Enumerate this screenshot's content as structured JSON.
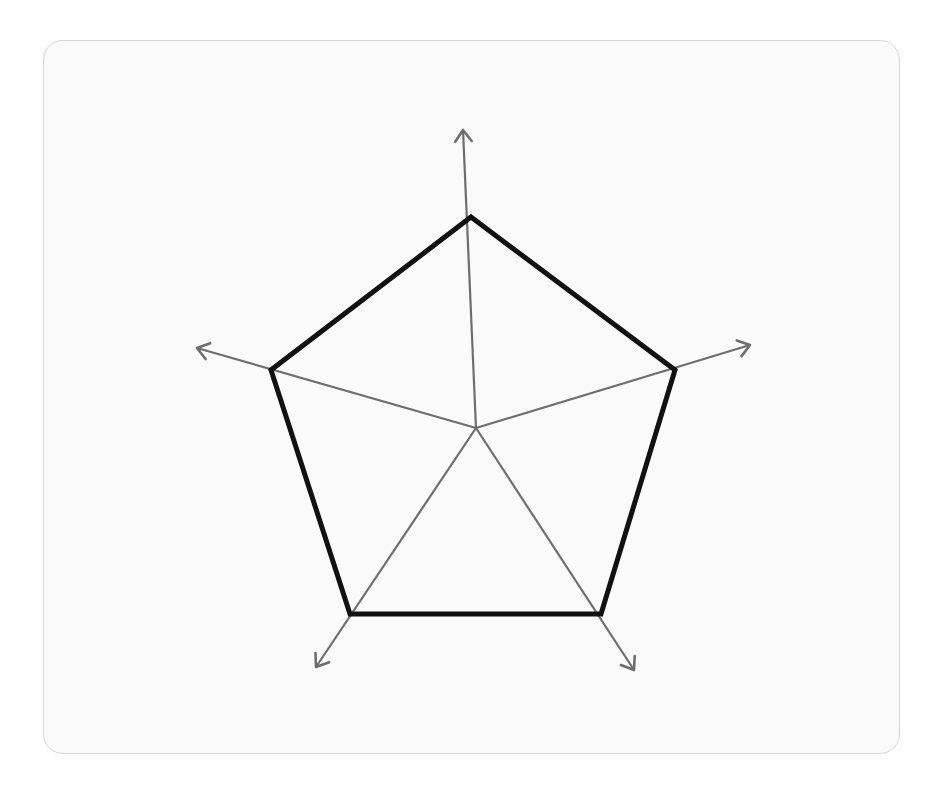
{
  "diagram": {
    "type": "radar-pentagon",
    "center": {
      "x": 476,
      "y": 428
    },
    "axis_color": "#6e6e6e",
    "polygon_color": "#111111",
    "card_background": "#fafafa",
    "card_border": "#d6d6d6",
    "axes": [
      {
        "name": "axis-top",
        "tip": [
          463,
          130
        ],
        "vertex": [
          471,
          217
        ]
      },
      {
        "name": "axis-right",
        "tip": [
          750,
          345
        ],
        "vertex": [
          675,
          370
        ]
      },
      {
        "name": "axis-bottom-right",
        "tip": [
          634,
          670
        ],
        "vertex": [
          601,
          614
        ]
      },
      {
        "name": "axis-bottom-left",
        "tip": [
          316,
          667
        ],
        "vertex": [
          350,
          614
        ]
      },
      {
        "name": "axis-left",
        "tip": [
          197,
          348
        ],
        "vertex": [
          271,
          370
        ]
      }
    ]
  }
}
